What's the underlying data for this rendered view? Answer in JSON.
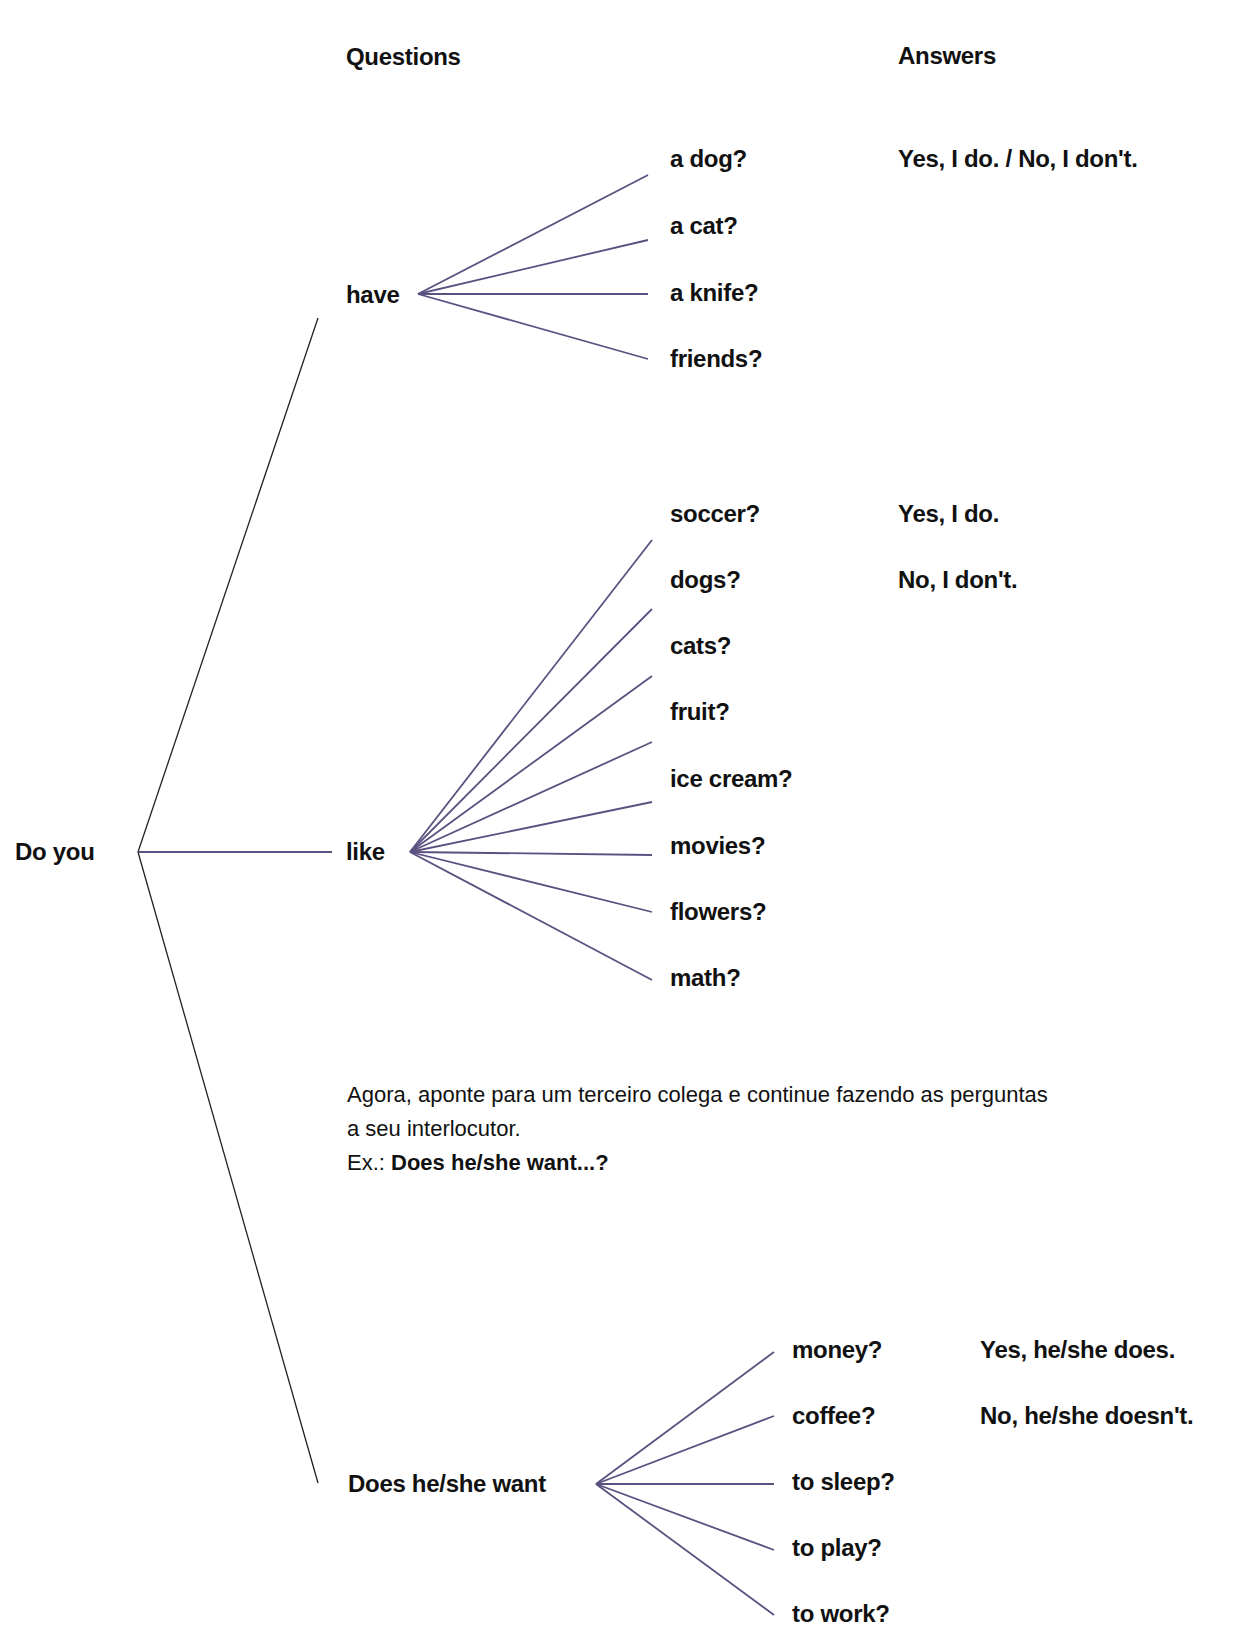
{
  "headers": {
    "questions": "Questions",
    "answers": "Answers"
  },
  "root": "Do you",
  "branches": {
    "have": {
      "label": "have",
      "items": [
        "a dog?",
        "a cat?",
        "a knife?",
        "friends?"
      ],
      "answers": [
        "Yes, I do. / No, I don't."
      ]
    },
    "like": {
      "label": "like",
      "items": [
        "soccer?",
        "dogs?",
        "cats?",
        "fruit?",
        "ice cream?",
        "movies?",
        "flowers?",
        "math?"
      ],
      "answers": [
        "Yes, I do.",
        "No, I don't."
      ]
    },
    "want": {
      "label": "Does he/she want",
      "items": [
        "money?",
        "coffee?",
        "to sleep?",
        "to play?",
        "to work?"
      ],
      "answers": [
        "Yes, he/she does.",
        "No, he/she doesn't."
      ]
    }
  },
  "instruction": {
    "line1": "Agora, aponte para um terceiro colega e continue fazendo as perguntas",
    "line2": "a seu interlocutor.",
    "example_prefix": "Ex.:",
    "example_text": "Does he/she want...?"
  },
  "colors": {
    "branch_line": "#5b5180",
    "trunk_line": "#222222",
    "text": "#111111"
  }
}
